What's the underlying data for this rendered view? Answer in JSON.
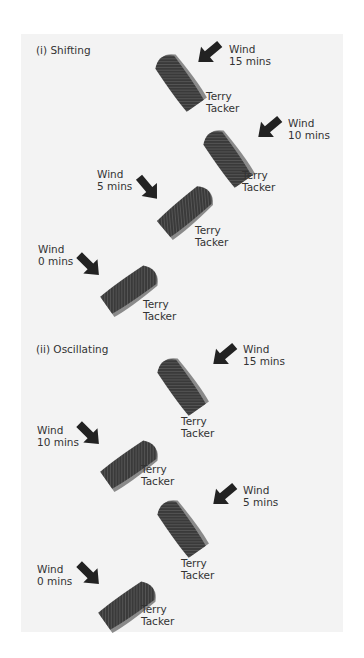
{
  "sections": [
    {
      "title": "(i) Shifting",
      "items": [
        {
          "wind": "Wind",
          "time": "15 mins",
          "boat_label_1": "Terry",
          "boat_label_2": "Tacker"
        },
        {
          "wind": "Wind",
          "time": "10 mins",
          "boat_label_1": "Terry",
          "boat_label_2": "Tacker"
        },
        {
          "wind": "Wind",
          "time": "5 mins",
          "boat_label_1": "Terry",
          "boat_label_2": "Tacker"
        },
        {
          "wind": "Wind",
          "time": "0 mins",
          "boat_label_1": "Terry",
          "boat_label_2": "Tacker"
        }
      ]
    },
    {
      "title": "(ii) Oscillating",
      "items": [
        {
          "wind": "Wind",
          "time": "15 mins",
          "boat_label_1": "Terry",
          "boat_label_2": "Tacker"
        },
        {
          "wind": "Wind",
          "time": "10 mins",
          "boat_label_1": "Terry",
          "boat_label_2": "Tacker"
        },
        {
          "wind": "Wind",
          "time": "5 mins",
          "boat_label_1": "Terry",
          "boat_label_2": "Tacker"
        },
        {
          "wind": "Wind",
          "time": "0 mins",
          "boat_label_1": "Terry",
          "boat_label_2": "Tacker"
        }
      ]
    }
  ],
  "colors": {
    "panel": "#f3f3f3",
    "hull": "#3a3a3a",
    "rim": "#8a8a8a",
    "arrow": "#222222",
    "text": "#333333"
  }
}
